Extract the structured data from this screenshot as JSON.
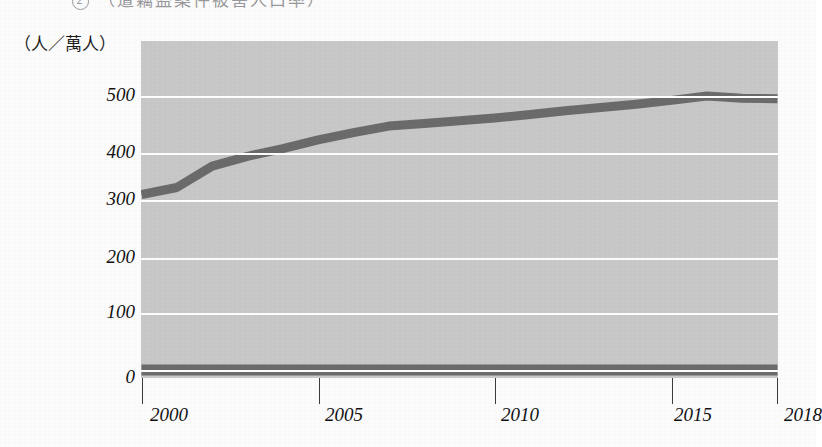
{
  "page": {
    "heading_marker": "2",
    "heading_text": "（遭竊盜案件被害人口率）",
    "background_color": "#fdfdfd"
  },
  "axis": {
    "unit_label": "（人／萬人）",
    "y_ticks": [
      "0",
      "100",
      "200",
      "300",
      "400",
      "500"
    ],
    "x_ticks": [
      "2000",
      "2005",
      "2010",
      "2015",
      "2018"
    ]
  },
  "colors": {
    "plot_background": "#c9c9c9",
    "gridline": "#ffffff",
    "series_line": "#6b6b6b",
    "baseline_series": "#6b6b6b",
    "tick_mark": "#3b3b3b",
    "text": "#111111"
  },
  "chart_data": {
    "type": "line",
    "title": "",
    "xlabel": "",
    "ylabel": "（人／萬人）",
    "xlim": [
      2000,
      2018
    ],
    "ylim": [
      0,
      540
    ],
    "grid": true,
    "legend_position": "none",
    "x": [
      2000,
      2001,
      2002,
      2003,
      2004,
      2005,
      2006,
      2007,
      2008,
      2009,
      2010,
      2011,
      2012,
      2013,
      2014,
      2015,
      2016,
      2017,
      2018
    ],
    "series": [
      {
        "name": "犯罪被害人口率",
        "color": "#6b6b6b",
        "values": [
          320,
          333,
          372,
          390,
          404,
          420,
          433,
          445,
          450,
          455,
          460,
          466,
          473,
          479,
          485,
          492,
          500,
          496,
          495
        ]
      },
      {
        "name": "基線",
        "color": "#6b6b6b",
        "values": [
          0,
          0,
          0,
          0,
          0,
          0,
          0,
          0,
          0,
          0,
          0,
          0,
          0,
          0,
          0,
          0,
          0,
          0,
          0
        ]
      }
    ]
  }
}
